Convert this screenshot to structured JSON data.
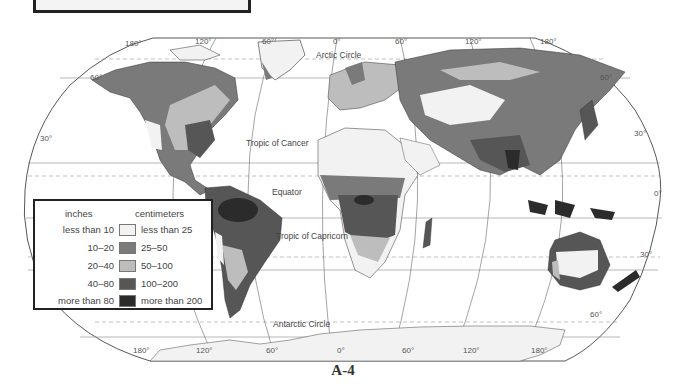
{
  "title_box": {
    "text": ""
  },
  "map": {
    "type": "choropleth-world-map",
    "subject": "World annual precipitation",
    "longitude_labels_top": [
      "180°",
      "120°",
      "60°",
      "0°",
      "60°",
      "120°",
      "180°"
    ],
    "longitude_labels_bottom": [
      "180°",
      "120°",
      "60°",
      "0°",
      "60°",
      "120°",
      "180°"
    ],
    "latitude_labels_left": [
      "60°",
      "30°"
    ],
    "latitude_labels_right": [
      "60°",
      "30°",
      "0°",
      "30°",
      "60°"
    ],
    "reference_lines": {
      "arctic_circle": "Arctic Circle",
      "tropic_of_cancer": "Tropic of Cancer",
      "equator": "Equator",
      "tropic_of_capricorn": "Tropic of Capricorn",
      "antarctic_circle": "Antarctic Circle"
    }
  },
  "legend": {
    "header_inches": "inches",
    "header_centimeters": "centimeters",
    "items": [
      {
        "inches": "less than 10",
        "centimeters": "less than 25",
        "color": "#f2f2f2"
      },
      {
        "inches": "10–20",
        "centimeters": "25–50",
        "color": "#7a7a7a"
      },
      {
        "inches": "20–40",
        "centimeters": "50–100",
        "color": "#bdbdbd"
      },
      {
        "inches": "40–80",
        "centimeters": "100–200",
        "color": "#565656"
      },
      {
        "inches": "more than 80",
        "centimeters": "more than 200",
        "color": "#2b2b2b"
      }
    ]
  },
  "caption": "A-4"
}
